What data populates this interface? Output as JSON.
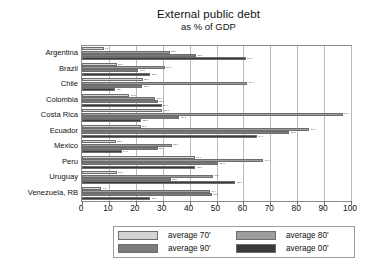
{
  "chart_data": {
    "type": "bar",
    "orientation": "horizontal",
    "title": "External public debt",
    "subtitle": "as % of GDP",
    "xlabel": "",
    "ylabel": "",
    "xlim": [
      0,
      100
    ],
    "xticks": [
      0,
      10,
      20,
      30,
      40,
      50,
      60,
      70,
      80,
      90,
      100
    ],
    "grid": true,
    "legend_position": "bottom",
    "categories": [
      "Argentina",
      "Brazil",
      "Chile",
      "Colombia",
      "Costa Rica",
      "Ecuador",
      "Mexico",
      "Peru",
      "Uruguay",
      "Venezuela, RB"
    ],
    "series": [
      {
        "name": "average 70'",
        "color": "#d4d4d4",
        "values": [
          8.1,
          12.9,
          22.6,
          17.5,
          29.8,
          21.9,
          12.5,
          41.9,
          13.0,
          7.1
        ],
        "labels": [
          "8.1",
          "12.9",
          "22.6",
          "17.5",
          "29.8",
          "21.9",
          "12.5",
          "41.9",
          "13.0",
          "7.1"
        ]
      },
      {
        "name": "average 80'",
        "color": "#9d9d9d",
        "values": [
          32.6,
          30.8,
          61.4,
          27.3,
          97.0,
          84.4,
          33.3,
          67.4,
          48.6,
          47.4
        ],
        "labels": [
          "32.6",
          "30.8",
          "61.4",
          "27.3",
          "97.0",
          "84.4",
          "33.3",
          "67.4",
          "48.6",
          "47.4"
        ]
      },
      {
        "name": "average 90'",
        "color": "#7b7b7b",
        "values": [
          42.2,
          21.0,
          22.4,
          28.1,
          36.1,
          77.0,
          28.1,
          50.7,
          33.0,
          48.2
        ],
        "labels": [
          "42.2",
          "21.0",
          "22.4",
          "28.1",
          "36.1",
          "77.0",
          "28.1",
          "50.7",
          "33.0",
          "48.2"
        ]
      },
      {
        "name": "average 00'",
        "color": "#3a3a3a",
        "values": [
          60.8,
          25.3,
          12.4,
          29.6,
          22.0,
          64.9,
          14.7,
          42.1,
          56.9,
          25.4
        ],
        "labels": [
          "60.8",
          "25.3",
          "12.4",
          "29.6",
          "22.0",
          "64.9",
          "14.7",
          "42.1",
          "56.9",
          "25.4"
        ]
      }
    ]
  },
  "legend": {
    "items": [
      {
        "label": "average 70'"
      },
      {
        "label": "average 80'"
      },
      {
        "label": "average 90'"
      },
      {
        "label": "average 00'"
      }
    ]
  }
}
